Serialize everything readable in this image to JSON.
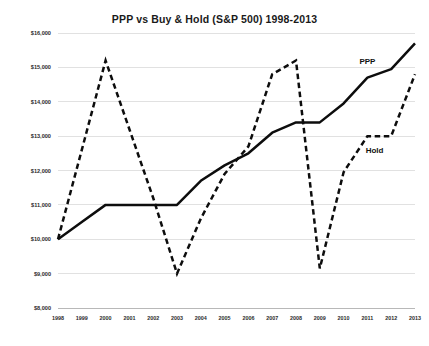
{
  "chart_data": {
    "type": "line",
    "title": "PPP vs Buy & Hold (S&P 500) 1998-2013",
    "xlabel": "",
    "ylabel": "",
    "grid": true,
    "legend_position": "inline-annotation",
    "x": [
      1998,
      1999,
      2000,
      2001,
      2002,
      2003,
      2004,
      2005,
      2006,
      2007,
      2008,
      2009,
      2010,
      2011,
      2012,
      2013
    ],
    "xticklabels": [
      "1998",
      "1999",
      "2000",
      "2001",
      "2002",
      "2003",
      "2004",
      "2005",
      "2006",
      "2007",
      "2008",
      "2009",
      "2010",
      "2011",
      "2012",
      "2013"
    ],
    "ylim": [
      8000,
      16000
    ],
    "yticks": [
      8000,
      9000,
      10000,
      11000,
      12000,
      13000,
      14000,
      15000,
      16000
    ],
    "yticklabels": [
      "$8,000",
      "$9,000",
      "$10,000",
      "$11,000",
      "$12,000",
      "$13,000",
      "$14,000",
      "$15,000",
      "$16,000"
    ],
    "series": [
      {
        "name": "PPP",
        "style": "solid",
        "color": "#0d0d0d",
        "values": [
          10000,
          10500,
          11000,
          11000,
          11000,
          11000,
          11700,
          12150,
          12500,
          13100,
          13400,
          13400,
          13950,
          14700,
          14950,
          15700
        ]
      },
      {
        "name": "Hold",
        "style": "dashed",
        "color": "#0d0d0d",
        "values": [
          10000,
          12600,
          15200,
          13200,
          11200,
          9000,
          10600,
          11900,
          12700,
          14800,
          15200,
          9150,
          11950,
          13000,
          13000,
          14800
        ]
      }
    ],
    "annotations": [
      {
        "text": "PPP",
        "x": 2011,
        "y": 15100
      },
      {
        "text": "Hold",
        "x": 2011.3,
        "y": 12500
      }
    ]
  },
  "axes": {
    "y_axis_label_color": "#2b2b2b",
    "x_axis_label_color": "#2b2b2b",
    "gridline_color": "#d9d9d9",
    "axis_color": "#b0b0b0"
  }
}
